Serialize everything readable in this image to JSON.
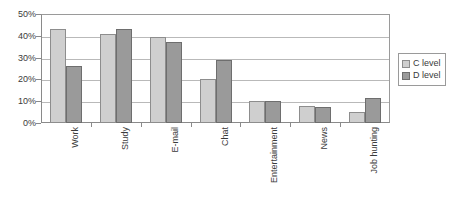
{
  "chart_data": {
    "type": "bar",
    "title": "",
    "subtitle": "",
    "xlabel": "",
    "ylabel": "",
    "ylim": [
      0,
      50
    ],
    "y_tick_labels": [
      "0%",
      "10%",
      "20%",
      "30%",
      "40%",
      "50%"
    ],
    "y_tick_values": [
      0,
      10,
      20,
      30,
      40,
      50
    ],
    "grid": true,
    "legend_position": "right",
    "categories": [
      "Work",
      "Study",
      "E-mail",
      "Chat",
      "Entertainment",
      "News",
      "Job hunting"
    ],
    "series": [
      {
        "name": "C level",
        "color": "#cfcfcf",
        "values": [
          43,
          41,
          39.5,
          20,
          10,
          8,
          5
        ]
      },
      {
        "name": "D level",
        "color": "#9a9a9a",
        "values": [
          26,
          43,
          37,
          29,
          10,
          7.5,
          11.5
        ]
      }
    ]
  },
  "legend": {
    "items": [
      {
        "label": "C level"
      },
      {
        "label": "D level"
      }
    ]
  }
}
